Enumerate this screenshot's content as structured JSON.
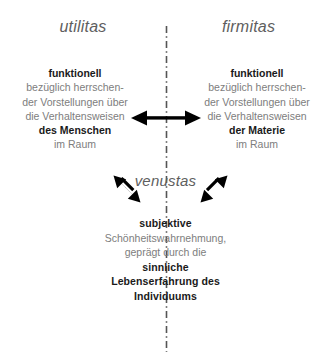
{
  "diagram": {
    "title_axes": {
      "left": "utilitas",
      "right": "firmitas",
      "bottom": "venustas"
    },
    "colors": {
      "background": "#ffffff",
      "body_text": "#7d7d7d",
      "emphasis_text": "#1a1a1a",
      "heading_text": "#5e5e5e",
      "axis_line": "#555555",
      "arrow": "#000000"
    },
    "left_block": {
      "line1": "funktionell",
      "line2": "bezüglich herrschen-",
      "line3": "der Vorstellungen über",
      "line4": "die Verhaltensweisen",
      "line5": "des Menschen",
      "line6": "im Raum"
    },
    "right_block": {
      "line1": "funktionell",
      "line2": "bezüglich herrschen-",
      "line3": "der Vorstellungen über",
      "line4": "die Verhaltensweisen",
      "line5": "der Materie",
      "line6": "im Raum"
    },
    "bottom_block": {
      "line1": "subjektive",
      "line2": "Schönheitswahrnehmung,",
      "line3": "geprägt durch die",
      "line4": "sinnliche",
      "line5": "Lebenserfahrung des",
      "line6": "Individuums"
    },
    "connectors": {
      "horizontal_arrow": "double-headed-horizontal-arrow",
      "diagonal_left_arrow": "double-headed-diagonal-arrow-left",
      "diagonal_right_arrow": "double-headed-diagonal-arrow-right",
      "vertical_axis": "dash-dot-vertical-line"
    }
  }
}
